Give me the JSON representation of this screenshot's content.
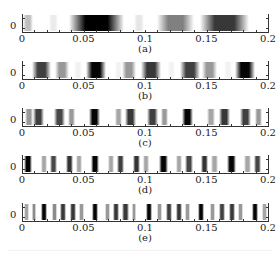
{
  "chart_data": [
    {
      "type": "heatmap",
      "panel": "a",
      "caption": "(a)",
      "xlim": [
        0,
        0.2
      ],
      "xticks": [
        "0",
        "0.05",
        "0.1",
        "0.15",
        "0.2"
      ],
      "yticks": [
        "0"
      ],
      "colormap": "grayscale (white=0, black=max)",
      "bands": [
        {
          "center": 0.003,
          "width": 0.008,
          "intensity": 0.25
        },
        {
          "center": 0.025,
          "width": 0.008,
          "intensity": 0.08
        },
        {
          "center": 0.06,
          "width": 0.045,
          "intensity": 1.0
        },
        {
          "center": 0.095,
          "width": 0.008,
          "intensity": 0.1
        },
        {
          "center": 0.125,
          "width": 0.03,
          "intensity": 0.5
        },
        {
          "center": 0.165,
          "width": 0.04,
          "intensity": 0.78
        }
      ]
    },
    {
      "type": "heatmap",
      "panel": "b",
      "caption": "(b)",
      "xlim": [
        0,
        0.2
      ],
      "xticks": [
        "0",
        "0.05",
        "0.1",
        "0.15",
        "0.2"
      ],
      "yticks": [
        "0"
      ],
      "bands": [
        {
          "center": 0.015,
          "width": 0.016,
          "intensity": 0.75
        },
        {
          "center": 0.032,
          "width": 0.012,
          "intensity": 0.4
        },
        {
          "center": 0.045,
          "width": 0.006,
          "intensity": 0.05
        },
        {
          "center": 0.06,
          "width": 0.016,
          "intensity": 0.98
        },
        {
          "center": 0.078,
          "width": 0.006,
          "intensity": 0.05
        },
        {
          "center": 0.087,
          "width": 0.012,
          "intensity": 0.4
        },
        {
          "center": 0.105,
          "width": 0.016,
          "intensity": 0.78
        },
        {
          "center": 0.122,
          "width": 0.006,
          "intensity": 0.05
        },
        {
          "center": 0.137,
          "width": 0.016,
          "intensity": 0.75
        },
        {
          "center": 0.153,
          "width": 0.012,
          "intensity": 0.4
        },
        {
          "center": 0.168,
          "width": 0.006,
          "intensity": 0.05
        },
        {
          "center": 0.182,
          "width": 0.016,
          "intensity": 0.98
        }
      ]
    },
    {
      "type": "heatmap",
      "panel": "c",
      "caption": "(c)",
      "xlim": [
        0,
        0.2
      ],
      "xticks": [
        "0",
        "0.05",
        "0.1",
        "0.15",
        "0.2"
      ],
      "yticks": [
        "0"
      ],
      "bands": [
        {
          "center": 0.005,
          "width": 0.006,
          "intensity": 0.4
        },
        {
          "center": 0.013,
          "width": 0.009,
          "intensity": 0.75
        },
        {
          "center": 0.03,
          "width": 0.009,
          "intensity": 0.72
        },
        {
          "center": 0.04,
          "width": 0.006,
          "intensity": 0.4
        },
        {
          "center": 0.059,
          "width": 0.009,
          "intensity": 0.98
        },
        {
          "center": 0.078,
          "width": 0.006,
          "intensity": 0.35
        },
        {
          "center": 0.088,
          "width": 0.009,
          "intensity": 0.78
        },
        {
          "center": 0.106,
          "width": 0.009,
          "intensity": 0.75
        },
        {
          "center": 0.116,
          "width": 0.006,
          "intensity": 0.4
        },
        {
          "center": 0.135,
          "width": 0.009,
          "intensity": 0.98
        },
        {
          "center": 0.154,
          "width": 0.006,
          "intensity": 0.35
        },
        {
          "center": 0.165,
          "width": 0.009,
          "intensity": 0.78
        },
        {
          "center": 0.182,
          "width": 0.009,
          "intensity": 0.75
        },
        {
          "center": 0.193,
          "width": 0.006,
          "intensity": 0.4
        }
      ]
    },
    {
      "type": "heatmap",
      "panel": "d",
      "caption": "(d)",
      "xlim": [
        0,
        0.2
      ],
      "xticks": [
        "0",
        "0.05",
        "0.1",
        "0.15",
        "0.2"
      ],
      "yticks": [
        "0"
      ],
      "bands": [
        {
          "center": 0.004,
          "width": 0.007,
          "intensity": 0.98
        },
        {
          "center": 0.017,
          "width": 0.005,
          "intensity": 0.35
        },
        {
          "center": 0.025,
          "width": 0.006,
          "intensity": 0.72
        },
        {
          "center": 0.038,
          "width": 0.006,
          "intensity": 0.8
        },
        {
          "center": 0.046,
          "width": 0.005,
          "intensity": 0.35
        },
        {
          "center": 0.059,
          "width": 0.007,
          "intensity": 0.98
        },
        {
          "center": 0.072,
          "width": 0.005,
          "intensity": 0.35
        },
        {
          "center": 0.08,
          "width": 0.006,
          "intensity": 0.75
        },
        {
          "center": 0.093,
          "width": 0.006,
          "intensity": 0.8
        },
        {
          "center": 0.101,
          "width": 0.005,
          "intensity": 0.35
        },
        {
          "center": 0.115,
          "width": 0.007,
          "intensity": 0.98
        },
        {
          "center": 0.128,
          "width": 0.005,
          "intensity": 0.35
        },
        {
          "center": 0.136,
          "width": 0.006,
          "intensity": 0.72
        },
        {
          "center": 0.149,
          "width": 0.006,
          "intensity": 0.8
        },
        {
          "center": 0.157,
          "width": 0.005,
          "intensity": 0.35
        },
        {
          "center": 0.171,
          "width": 0.007,
          "intensity": 0.98
        },
        {
          "center": 0.184,
          "width": 0.005,
          "intensity": 0.35
        },
        {
          "center": 0.192,
          "width": 0.006,
          "intensity": 0.72
        }
      ]
    },
    {
      "type": "heatmap",
      "panel": "e",
      "caption": "(e)",
      "xlim": [
        0,
        0.2
      ],
      "xticks": [
        "0",
        "0.05",
        "0.1",
        "0.15",
        "0.2"
      ],
      "yticks": [
        "0"
      ],
      "bands": [
        {
          "center": 0.003,
          "width": 0.004,
          "intensity": 0.35
        },
        {
          "center": 0.009,
          "width": 0.004,
          "intensity": 0.45
        },
        {
          "center": 0.017,
          "width": 0.005,
          "intensity": 0.98
        },
        {
          "center": 0.026,
          "width": 0.004,
          "intensity": 0.45
        },
        {
          "center": 0.033,
          "width": 0.005,
          "intensity": 0.78
        },
        {
          "center": 0.041,
          "width": 0.005,
          "intensity": 0.78
        },
        {
          "center": 0.048,
          "width": 0.004,
          "intensity": 0.4
        },
        {
          "center": 0.059,
          "width": 0.005,
          "intensity": 0.98
        },
        {
          "center": 0.069,
          "width": 0.004,
          "intensity": 0.4
        },
        {
          "center": 0.076,
          "width": 0.005,
          "intensity": 0.78
        },
        {
          "center": 0.084,
          "width": 0.005,
          "intensity": 0.78
        },
        {
          "center": 0.091,
          "width": 0.004,
          "intensity": 0.4
        },
        {
          "center": 0.103,
          "width": 0.005,
          "intensity": 0.98
        },
        {
          "center": 0.112,
          "width": 0.004,
          "intensity": 0.4
        },
        {
          "center": 0.12,
          "width": 0.005,
          "intensity": 0.75
        },
        {
          "center": 0.128,
          "width": 0.005,
          "intensity": 0.78
        },
        {
          "center": 0.135,
          "width": 0.004,
          "intensity": 0.4
        },
        {
          "center": 0.146,
          "width": 0.005,
          "intensity": 0.98
        },
        {
          "center": 0.155,
          "width": 0.004,
          "intensity": 0.4
        },
        {
          "center": 0.163,
          "width": 0.005,
          "intensity": 0.75
        },
        {
          "center": 0.171,
          "width": 0.005,
          "intensity": 0.78
        },
        {
          "center": 0.178,
          "width": 0.004,
          "intensity": 0.4
        },
        {
          "center": 0.19,
          "width": 0.005,
          "intensity": 0.98
        },
        {
          "center": 0.198,
          "width": 0.004,
          "intensity": 0.35
        }
      ]
    }
  ],
  "panels": [
    {
      "caption": "(a)",
      "ylabel": "0"
    },
    {
      "caption": "(b)",
      "ylabel": "0"
    },
    {
      "caption": "(c)",
      "ylabel": "0"
    },
    {
      "caption": "(d)",
      "ylabel": "0"
    },
    {
      "caption": "(e)",
      "ylabel": "0"
    }
  ],
  "xticks": [
    "0",
    "0.05",
    "0.1",
    "0.15",
    "0.2"
  ]
}
